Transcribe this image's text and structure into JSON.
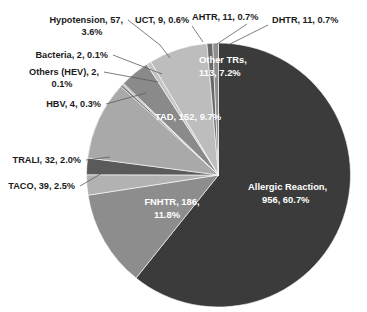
{
  "chart_data": {
    "type": "pie",
    "title": "",
    "total": 1575,
    "legend_position": "none",
    "grid": false,
    "value_format": "name, count, percent",
    "categories": [
      "Allergic Reaction",
      "FNHTR",
      "TACO",
      "TRALI",
      "TAD",
      "HBV",
      "Others (HEV)",
      "Bacteria",
      "Hypotension",
      "UCT",
      "Other TRs",
      "AHTR",
      "DHTR"
    ],
    "values": [
      956,
      186,
      39,
      32,
      152,
      4,
      2,
      2,
      57,
      9,
      113,
      11,
      11
    ],
    "percents": [
      60.7,
      11.8,
      2.5,
      2.0,
      9.7,
      0.3,
      0.1,
      0.1,
      3.6,
      0.6,
      7.2,
      0.7,
      0.7
    ],
    "slices": [
      {
        "name": "Allergic Reaction",
        "value": 956,
        "percent": 60.7,
        "label": "Allergic Reaction, 956, 60.7%",
        "color": "#3b3b3b",
        "placement": "inside"
      },
      {
        "name": "FNHTR",
        "value": 186,
        "percent": 11.8,
        "label": "FNHTR, 186, 11.8%",
        "color": "#8d8d8d",
        "placement": "inside"
      },
      {
        "name": "TACO",
        "value": 39,
        "percent": 2.5,
        "label": "TACO, 39, 2.5%",
        "color": "#b2b2b2",
        "placement": "outside"
      },
      {
        "name": "TRALI",
        "value": 32,
        "percent": 2.0,
        "label": "TRALI, 32, 2.0%",
        "color": "#5a5a5a",
        "placement": "outside"
      },
      {
        "name": "TAD",
        "value": 152,
        "percent": 9.7,
        "label": "TAD, 152, 9.7%",
        "color": "#a9a9a9",
        "placement": "inside"
      },
      {
        "name": "HBV",
        "value": 4,
        "percent": 0.3,
        "label": "HBV, 4, 0.3%",
        "color": "#6e6e6e",
        "placement": "outside"
      },
      {
        "name": "Others (HEV)",
        "value": 2,
        "percent": 0.1,
        "label": "Others (HEV), 2, 0.1%",
        "color": "#9c9c9c",
        "placement": "outside"
      },
      {
        "name": "Bacteria",
        "value": 2,
        "percent": 0.1,
        "label": "Bacteria, 2, 0.1%",
        "color": "#777777",
        "placement": "outside"
      },
      {
        "name": "Hypotension",
        "value": 57,
        "percent": 3.6,
        "label": "Hypotension, 57, 3.6%",
        "color": "#8a8a8a",
        "placement": "outside"
      },
      {
        "name": "UCT",
        "value": 9,
        "percent": 0.6,
        "label": "UCT, 9, 0.6%",
        "color": "#c4c4c4",
        "placement": "outside"
      },
      {
        "name": "Other TRs",
        "value": 113,
        "percent": 7.2,
        "label": "Other TRs, 113, 7.2%",
        "color": "#bdbdbd",
        "placement": "inside"
      },
      {
        "name": "AHTR",
        "value": 11,
        "percent": 0.7,
        "label": "AHTR, 11, 0.7%",
        "color": "#6a6a6a",
        "placement": "outside"
      },
      {
        "name": "DHTR",
        "value": 11,
        "percent": 0.7,
        "label": "DHTR, 11, 0.7%",
        "color": "#8f8f8f",
        "placement": "outside"
      }
    ]
  },
  "labels": {
    "hypotension_line1": "Hypotension, 57,",
    "hypotension_line2": "3.6%",
    "uct": "UCT, 9, 0.6%",
    "ahtr": "AHTR, 11, 0.7%",
    "dhtr": "DHTR, 11, 0.7%",
    "bacteria": "Bacteria, 2, 0.1%",
    "others_hev_line1": "Others (HEV), 2,",
    "others_hev_line2": "0.1%",
    "hbv": "HBV, 4, 0.3%",
    "trali": "TRALI, 32, 2.0%",
    "taco": "TACO, 39, 2.5%",
    "other_trs_line1": "Other TRs,",
    "other_trs_line2": "113, 7.2%",
    "tad": "TAD, 152, 9.7%",
    "fnhtr_line1": "FNHTR, 186,",
    "fnhtr_line2": "11.8%",
    "allergic_line1": "Allergic Reaction,",
    "allergic_line2": "956, 60.7%"
  },
  "colors": {
    "background": "#ffffff",
    "label_text": "#1b1b1b",
    "inside_label_text": "#ffffff",
    "leader_line": "#5c5c5c"
  }
}
